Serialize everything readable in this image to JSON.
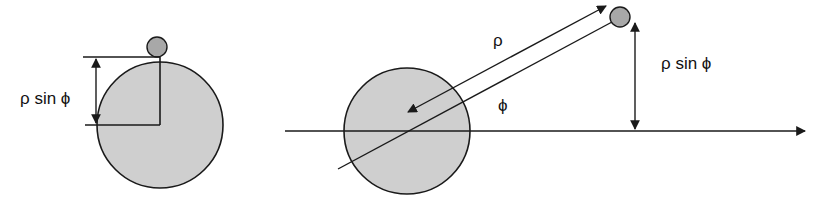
{
  "left_panel": {
    "label_height": "ρ sin ϕ"
  },
  "right_panel": {
    "label_rho": "ρ",
    "label_phi": "ϕ",
    "label_height": "ρ sin ϕ"
  },
  "colors": {
    "body_fill": "#cfcfcf",
    "satellite_fill": "#a8a8a8",
    "stroke": "#1a1a1a",
    "background": "#ffffff"
  }
}
